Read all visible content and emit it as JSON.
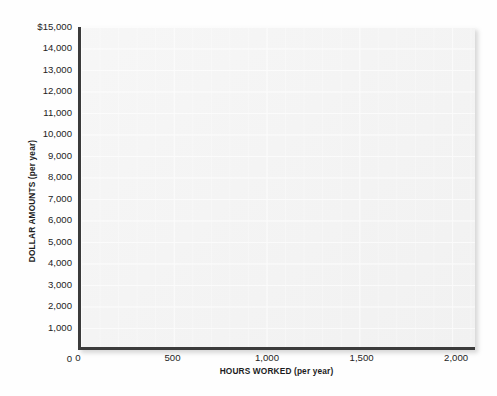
{
  "chart_data": {
    "type": "scatter",
    "title": "",
    "subtitle": "",
    "xlabel": "HOURS WORKED (per year)",
    "ylabel": "DOLLAR AMOUNTS (per year)",
    "xlim": [
      0,
      2100
    ],
    "ylim": [
      0,
      15000
    ],
    "x_ticks": [
      0,
      500,
      1000,
      1500,
      2000
    ],
    "x_tick_labels": [
      "0",
      "500",
      "1,000",
      "1,500",
      "2,000"
    ],
    "y_ticks": [
      1000,
      2000,
      3000,
      4000,
      5000,
      6000,
      7000,
      8000,
      9000,
      10000,
      11000,
      12000,
      13000,
      14000,
      15000
    ],
    "y_tick_labels": [
      "1,000",
      "2,000",
      "3,000",
      "4,000",
      "5,000",
      "6,000",
      "7,000",
      "8,000",
      "9,000",
      "10,000",
      "11,000",
      "12,000",
      "13,000",
      "14,000",
      "$15,000"
    ],
    "y_zero_label": "0",
    "grid": true,
    "grid_minor_x_step": 100,
    "grid_major_x_step": 500,
    "grid_y_step": 1000,
    "legend": null,
    "series": [],
    "values": [],
    "annotations": [],
    "colors": {
      "plot_background": "#f2f2f2",
      "grid_line": "#ffffff",
      "axis_line": "#3b3b3b",
      "text": "#1d1d1d",
      "page_background": "#fefefe"
    }
  }
}
